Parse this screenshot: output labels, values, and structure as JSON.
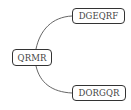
{
  "diagram": {
    "root": {
      "label": "QRMR"
    },
    "children": [
      {
        "label": "DGEQRF"
      },
      {
        "label": "DORGQR"
      }
    ],
    "colors": {
      "edge": "#555555",
      "border": "#333333",
      "text": "#444444",
      "background": "#ffffff"
    }
  }
}
